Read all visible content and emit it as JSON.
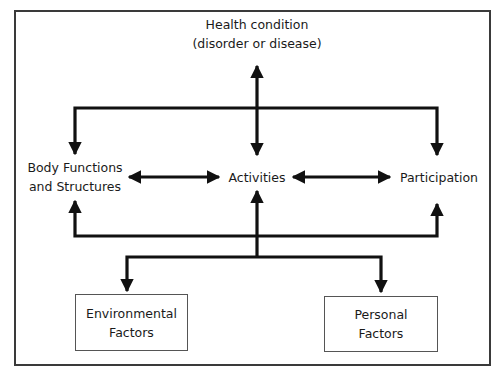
{
  "diagram": {
    "type": "ICF model of functioning and disability",
    "nodes": {
      "health_condition": {
        "line1": "Health condition",
        "line2": "(disorder or disease)"
      },
      "body_functions": {
        "line1": "Body Functions",
        "line2": "and Structures"
      },
      "activities": {
        "label": "Activities"
      },
      "participation": {
        "label": "Participation"
      },
      "environmental_factors": {
        "line1": "Environmental",
        "line2": "Factors"
      },
      "personal_factors": {
        "line1": "Personal",
        "line2": "Factors"
      }
    },
    "edges": [
      {
        "from": "health_condition",
        "to": "activities",
        "direction": "both"
      },
      {
        "from": "health_condition",
        "to": "body_functions",
        "direction": "forward"
      },
      {
        "from": "health_condition",
        "to": "participation",
        "direction": "forward"
      },
      {
        "from": "body_functions",
        "to": "activities",
        "direction": "both"
      },
      {
        "from": "activities",
        "to": "participation",
        "direction": "both"
      },
      {
        "from": "contextual_factors",
        "to": "body_functions",
        "direction": "forward"
      },
      {
        "from": "contextual_factors",
        "to": "activities",
        "direction": "forward"
      },
      {
        "from": "contextual_factors",
        "to": "participation",
        "direction": "forward"
      },
      {
        "from": "activities",
        "to": "environmental_factors",
        "direction": "forward"
      },
      {
        "from": "activities",
        "to": "personal_factors",
        "direction": "forward"
      }
    ],
    "colors": {
      "line": "#111111",
      "frame": "#3a3a3a",
      "box_border": "#555555",
      "background": "#ffffff"
    }
  }
}
